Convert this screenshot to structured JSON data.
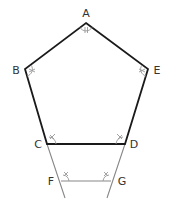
{
  "diagram": {
    "colors": {
      "pentagon": "#1a1a1a",
      "construction": "#888888",
      "arc": "#999999",
      "label": "#333333"
    },
    "vertices": [
      {
        "id": "A",
        "label": "A",
        "x": 86,
        "y": 23,
        "lx": 86,
        "ly": 17
      },
      {
        "id": "B",
        "label": "B",
        "x": 25,
        "y": 69,
        "lx": 16,
        "ly": 74
      },
      {
        "id": "E",
        "label": "E",
        "x": 148,
        "y": 69,
        "lx": 157,
        "ly": 74
      },
      {
        "id": "C",
        "label": "C",
        "x": 47,
        "y": 144,
        "lx": 38,
        "ly": 148
      },
      {
        "id": "D",
        "label": "D",
        "x": 125,
        "y": 144,
        "lx": 134,
        "ly": 148
      },
      {
        "id": "F",
        "label": "F",
        "x": 61,
        "y": 181,
        "lx": 51,
        "ly": 185
      },
      {
        "id": "G",
        "label": "G",
        "x": 111,
        "y": 181,
        "lx": 122,
        "ly": 185
      }
    ],
    "pentagon_edges": [
      "AB",
      "BC",
      "CD",
      "DE",
      "EA"
    ],
    "construction_lines": [
      {
        "name": "C-F-extension",
        "from": [
          47,
          144
        ],
        "to": [
          65,
          198
        ]
      },
      {
        "name": "D-G-extension",
        "from": [
          125,
          144
        ],
        "to": [
          107,
          198
        ]
      },
      {
        "name": "FG",
        "from": [
          61,
          181
        ],
        "to": [
          111,
          181
        ]
      }
    ],
    "angle_marks": [
      {
        "at": "A",
        "ticks": 2
      },
      {
        "at": "B",
        "ticks": 2
      },
      {
        "at": "E",
        "ticks": 2
      },
      {
        "at": "C",
        "ticks": 1
      },
      {
        "at": "D",
        "ticks": 1
      },
      {
        "at": "F",
        "ticks": 1
      },
      {
        "at": "G",
        "ticks": 1
      }
    ]
  }
}
